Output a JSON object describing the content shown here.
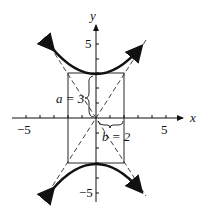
{
  "diagram": {
    "axes": {
      "x_label": "x",
      "y_label": "y",
      "x_ticks": {
        "neg": "−5",
        "pos": "5"
      },
      "y_ticks": {
        "pos": "5",
        "neg": "−5"
      }
    },
    "annotations": {
      "a_label": "a = 3",
      "b_label": "b = 2"
    },
    "colors": {
      "ink": "#111111",
      "background": "#ffffff"
    }
  }
}
